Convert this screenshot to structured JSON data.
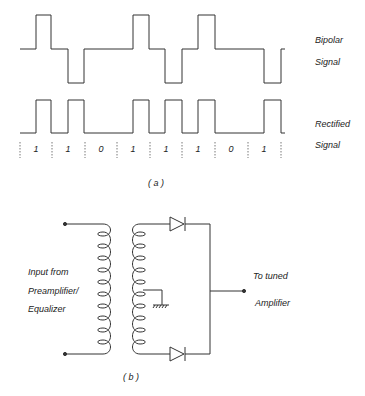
{
  "figure_a": {
    "caption": "( a )",
    "bipolar_label_1": "Bipolar",
    "bipolar_label_2": "Signal",
    "rectified_label_1": "Rectified",
    "rectified_label_2": "Signal",
    "bits": [
      "1",
      "1",
      "0",
      "1",
      "1",
      "1",
      "0",
      "1"
    ]
  },
  "figure_b": {
    "caption": "( b )",
    "input_label_1": "Input  from",
    "input_label_2": "Preamplifier/",
    "input_label_3": "Equalizer",
    "output_label_1": "To  tuned",
    "output_label_2": "Amplifier"
  },
  "colors": {
    "line": "#333333",
    "background": "#ffffff"
  }
}
